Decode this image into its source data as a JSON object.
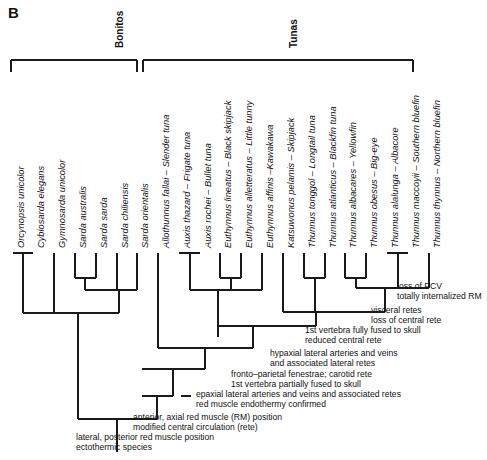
{
  "figure": {
    "panel_label": "B",
    "width": 487,
    "height": 460,
    "line_color": "#1a1a1a",
    "background": "#ffffff"
  },
  "groups": [
    {
      "name": "Bonitos",
      "label": "Bonitos",
      "bracket_x1": 11,
      "bracket_x2": 137,
      "label_x": 114,
      "label_y": 48
    },
    {
      "name": "Tunas",
      "label": "Tunas",
      "bracket_x1": 143,
      "bracket_x2": 413,
      "label_x": 288,
      "label_y": 48
    }
  ],
  "tips": [
    {
      "genus_species": "Orcynopsis unicolor",
      "common": "",
      "label": "Orcynopsis unicolor",
      "x": 13,
      "group": "Bonitos"
    },
    {
      "genus_species": "Cybiosarda elegans",
      "common": "",
      "label": "Cybiosarda elegans",
      "x": 33,
      "group": "Bonitos"
    },
    {
      "genus_species": "Gymnosarda unicolor",
      "common": "",
      "label": "Gymnosarda unicolor",
      "x": 54,
      "group": "Bonitos"
    },
    {
      "genus_species": "Sarda australis",
      "common": "",
      "label": "Sarda australis",
      "x": 75,
      "group": "Bonitos"
    },
    {
      "genus_species": "Sarda sarda",
      "common": "",
      "label": "Sarda sarda",
      "x": 96,
      "group": "Bonitos"
    },
    {
      "genus_species": "Sarda chiliensis",
      "common": "",
      "label": "Sarda chiliensis",
      "x": 117,
      "group": "Bonitos"
    },
    {
      "genus_species": "Sarda orientalis",
      "common": "",
      "label": "Sarda orientalis",
      "x": 137,
      "group": "Bonitos"
    },
    {
      "genus_species": "Allothunnus fallai",
      "common": "Slender tuna",
      "label": "Allothunnus fallai – Slender tuna",
      "x": 158,
      "group": "Tunas"
    },
    {
      "genus_species": "Auxis thazard",
      "common": "Frigate tuna",
      "label": "Auxis thazard – Frigate tuna",
      "x": 179,
      "group": "Tunas"
    },
    {
      "genus_species": "Auxis rochei",
      "common": "Bullet tuna",
      "label": "Auxis rochei – Bullet tuna",
      "x": 200,
      "group": "Tunas"
    },
    {
      "genus_species": "Euthynnus lineatus",
      "common": "Black skipjack",
      "label": "Euthynnus lineatus – Black skipjack",
      "x": 220,
      "group": "Tunas"
    },
    {
      "genus_species": "Euthynnus alletteratus",
      "common": "Little tunny",
      "label": "Euthynnus alletteratus – Little tunny",
      "x": 241,
      "group": "Tunas"
    },
    {
      "genus_species": "Euthynnus affinis",
      "common": "Kawakawa",
      "label": "Euthynnus affinis –Kawakawa",
      "x": 262,
      "group": "Tunas"
    },
    {
      "genus_species": "Katsuwonus pelamis",
      "common": "Skipjack",
      "label": "Katsuwonus pelamis – Skipjack",
      "x": 283,
      "group": "Tunas"
    },
    {
      "genus_species": "Thunnus tonggol",
      "common": "Longtail tuna",
      "label": "Thunnus tonggol – Longtail tuna",
      "x": 304,
      "group": "Tunas"
    },
    {
      "genus_species": "Thunnus atlanticus",
      "common": "Blackfin tuna",
      "label": "Thunnus atlanticus – Blackfin tuna",
      "x": 325,
      "group": "Tunas"
    },
    {
      "genus_species": "Thunnus albacares",
      "common": "Yellowfin",
      "label": "Thunnus albacares – Yellowfin",
      "x": 345,
      "group": "Tunas"
    },
    {
      "genus_species": "Thunnus obesus",
      "common": "Big-eye",
      "label": "Thunnus obesus – Big-eye",
      "x": 366,
      "group": "Tunas"
    },
    {
      "genus_species": "Thunnus alalunga",
      "common": "Albacore",
      "label": "Thunnus alalunga – Albacore",
      "x": 387,
      "group": "Tunas"
    },
    {
      "genus_species": "Thunnus maccoyii",
      "common": "Southern bluefin",
      "label": "Thunnus maccoyii – Southern bluefin",
      "x": 408,
      "group": "Tunas"
    },
    {
      "genus_species": "Thunnus thynnus",
      "common": "Northern bluefin",
      "label": "Thunnus thynnus – Northern bluefin",
      "x": 429,
      "group": "Tunas"
    }
  ],
  "annotations": [
    {
      "id": "loss-of-pcv",
      "lines": [
        "loss of PCV",
        "totally internalized RM"
      ],
      "text_x": 397,
      "text_y": 281,
      "tick_x": 387,
      "tick_y": 288
    },
    {
      "id": "visceral-retes",
      "lines": [
        "visceral retes",
        "loss of central rete"
      ],
      "text_x": 371,
      "text_y": 305,
      "tick_x": 361,
      "tick_y": 312
    },
    {
      "id": "first-vertebra-fully-fused",
      "lines": [
        "1st vertebra fully fused to skull",
        "reduced central rete"
      ],
      "text_x": 305,
      "text_y": 325,
      "tick_x": null,
      "tick_y": null
    },
    {
      "id": "hypaxial-lateral-arteries",
      "lines": [
        "hypaxial lateral arteries and veins",
        "and associated lateral retes"
      ],
      "text_x": 270,
      "text_y": 348,
      "tick_x": null,
      "tick_y": null
    },
    {
      "id": "fronto-parietal-fenestrae",
      "lines": [
        "fronto–parietal fenestrae; carotid rete",
        "1st vertebra partially fused to skull"
      ],
      "text_x": 231,
      "text_y": 369,
      "tick_x": null,
      "tick_y": null
    },
    {
      "id": "epaxial-lateral-arteries",
      "lines": [
        "epaxial lateral arteries and veins and associated retes",
        "red muscle endothermy confirmed"
      ],
      "text_x": 196,
      "text_y": 389,
      "tick_x": 186,
      "tick_y": 396
    },
    {
      "id": "anterior-axial-red-muscle",
      "lines": [
        "anterior, axial red muscle (RM) position",
        "modified central circulation (rete)"
      ],
      "text_x": 133,
      "text_y": 412,
      "tick_x": 123,
      "tick_y": 419
    },
    {
      "id": "lateral-posterior-red-muscle",
      "lines": [
        "lateral, posterior red muscle position",
        "ectothermic species"
      ],
      "text_x": 76,
      "text_y": 432,
      "tick_x": null,
      "tick_y": null
    }
  ],
  "tree": {
    "tip_top_y": 253,
    "nodes": [
      {
        "id": "orcynopsis-cybiosarda",
        "children_x": [
          13,
          33
        ],
        "bar_y": 253,
        "x": 23,
        "stem_to_y": 313
      },
      {
        "id": "sarda-australis-sarda",
        "children_x": [
          75,
          96
        ],
        "bar_y": 278,
        "x": 85,
        "stem_to_y": 290
      },
      {
        "id": "sarda-core",
        "children_x": [
          85,
          117
        ],
        "bar_y": 290,
        "x": 101,
        "stem_to_y": 290
      },
      {
        "id": "sarda-clade",
        "children_x": [
          101,
          137
        ],
        "bar_y": 290,
        "x": 119,
        "stem_to_y": 313
      },
      {
        "id": "bonito-node-a",
        "children_x": [
          23,
          54
        ],
        "bar_y": 313,
        "x": 38,
        "stem_to_y": 313
      },
      {
        "id": "bonito-root",
        "children_x": [
          38,
          119
        ],
        "bar_y": 313,
        "x": 78,
        "stem_to_y": 419
      },
      {
        "id": "auxis",
        "children_x": [
          179,
          200
        ],
        "bar_y": 253,
        "x": 190,
        "stem_to_y": 290
      },
      {
        "id": "euthynnus-lineatus-alletteratus",
        "children_x": [
          220,
          241
        ],
        "bar_y": 278,
        "x": 231,
        "stem_to_y": 290
      },
      {
        "id": "euthynnus",
        "children_x": [
          231,
          262
        ],
        "bar_y": 290,
        "x": 246,
        "stem_to_y": 290
      },
      {
        "id": "auxis-euthynnus",
        "children_x": [
          190,
          246
        ],
        "bar_y": 290,
        "x": 218,
        "stem_to_y": 337
      },
      {
        "id": "thunnus-tonggol-atlanticus",
        "children_x": [
          304,
          325
        ],
        "bar_y": 278,
        "x": 315,
        "stem_to_y": 288
      },
      {
        "id": "thunnus-alalunga-maccoyii",
        "children_x": [
          387,
          408
        ],
        "bar_y": 253,
        "x": 398,
        "stem_to_y": 288
      },
      {
        "id": "thunnus-bluefin-group",
        "children_x": [
          398,
          429
        ],
        "bar_y": 288,
        "x": 413,
        "stem_to_y": 288
      },
      {
        "id": "thunnus-yellowfin-bigeye",
        "children_x": [
          345,
          366
        ],
        "bar_y": 278,
        "x": 356,
        "stem_to_y": 288
      },
      {
        "id": "thunnus-upper",
        "children_x": [
          356,
          413
        ],
        "bar_y": 288,
        "x": 385,
        "stem_to_y": 312
      },
      {
        "id": "thunnus-lower",
        "children_x": [
          315,
          385
        ],
        "bar_y": 312,
        "x": 350,
        "stem_to_y": 312
      },
      {
        "id": "thunnus-clade",
        "children_x": [
          283,
          350
        ],
        "bar_y": 312,
        "x": 316,
        "stem_to_y": 326
      },
      {
        "id": "katsuwonus-thunnus",
        "children_x": [
          262,
          316
        ],
        "bar_y": 326,
        "x": 289,
        "stem_to_y": 326
      },
      {
        "id": "tuna-core",
        "children_x": [
          218,
          289
        ],
        "bar_y": 326,
        "x": 253,
        "stem_to_y": 348
      },
      {
        "id": "tuna-hypaxial",
        "children_x": [
          158,
          253
        ],
        "bar_y": 348,
        "x": 205,
        "stem_to_y": 369
      },
      {
        "id": "tuna-fronto-parietal",
        "children_x": [
          142,
          205
        ],
        "bar_y": 369,
        "x": 173,
        "stem_to_y": 396
      },
      {
        "id": "epaxial-node",
        "children_x": [
          142,
          173
        ],
        "bar_y": 396,
        "x": 157,
        "stem_to_y": 419
      },
      {
        "id": "root-node",
        "children_x": [
          78,
          157
        ],
        "bar_y": 419,
        "x": 117,
        "stem_to_y": 452
      }
    ]
  }
}
